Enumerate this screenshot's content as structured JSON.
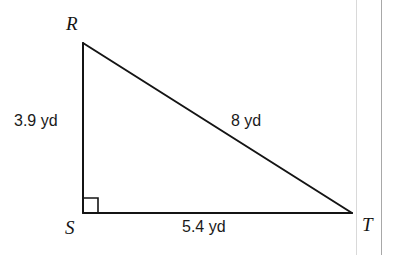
{
  "figure": {
    "kind": "right-triangle",
    "name": "Triangle RST",
    "background_color": "#ffffff",
    "stroke_color": "#141414",
    "stroke_width": 2,
    "vertices": [
      {
        "id": "R",
        "label": "R",
        "x": 83,
        "y": 43,
        "label_x": 66,
        "label_y": 14
      },
      {
        "id": "S",
        "label": "S",
        "x": 83,
        "y": 213,
        "label_x": 65,
        "label_y": 218
      },
      {
        "id": "T",
        "label": "T",
        "x": 352,
        "y": 213,
        "label_x": 362,
        "label_y": 215
      }
    ],
    "sides": [
      {
        "id": "RS",
        "from": "R",
        "to": "S",
        "label": "3.9 yd",
        "role": "vertical-leg"
      },
      {
        "id": "RT",
        "from": "R",
        "to": "T",
        "label": "8 yd",
        "role": "hypotenuse"
      },
      {
        "id": "ST",
        "from": "S",
        "to": "T",
        "label": "5.4 yd",
        "role": "horizontal-leg"
      }
    ],
    "right_angle": {
      "at_vertex": "S",
      "marker": "square",
      "size": 15,
      "stroke_width": 1.6
    },
    "units": "yd"
  },
  "labels": {
    "vertex_r": "R",
    "vertex_s": "S",
    "vertex_t": "T",
    "side_rs": "3.9 yd",
    "side_rt": "8 yd",
    "side_st": "5.4 yd"
  },
  "scan_artifacts": {
    "inner_line_color": "#d9d9d9",
    "outer_line_color": "#a8a8a8"
  }
}
